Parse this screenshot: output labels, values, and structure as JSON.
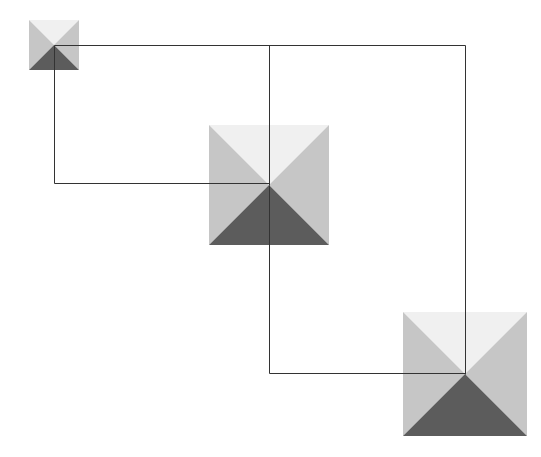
{
  "canvas": {
    "width": 541,
    "height": 457,
    "background": "#ffffff"
  },
  "colors": {
    "top": "#f0f0f0",
    "side": "#c6c6c6",
    "bottom": "#5c5c5c",
    "connector": "#333333"
  },
  "nodes": [
    {
      "id": "node-small",
      "cx": 54,
      "cy": 45,
      "size": 50
    },
    {
      "id": "node-medium",
      "cx": 269,
      "cy": 185,
      "size": 120
    },
    {
      "id": "node-large",
      "cx": 465,
      "cy": 374,
      "size": 124
    }
  ],
  "connectors": [
    {
      "id": "connector-top",
      "points": [
        [
          54,
          45
        ],
        [
          465,
          45
        ],
        [
          465,
          374
        ]
      ]
    },
    {
      "id": "connector-middle-drop",
      "points": [
        [
          269,
          45
        ],
        [
          269,
          185
        ]
      ]
    },
    {
      "id": "connector-left-loop",
      "points": [
        [
          54,
          45
        ],
        [
          54,
          183
        ],
        [
          269,
          183
        ]
      ]
    },
    {
      "id": "connector-lower-loop",
      "points": [
        [
          269,
          185
        ],
        [
          269,
          373
        ],
        [
          465,
          373
        ]
      ]
    }
  ]
}
